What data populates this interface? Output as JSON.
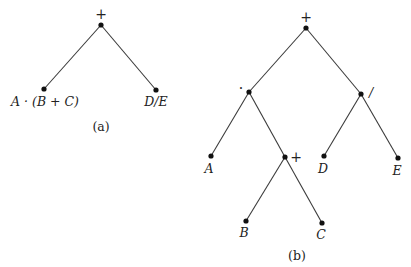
{
  "diagram_a": {
    "caption": "(a)",
    "root": {
      "label": "+",
      "x": 101,
      "y": 25
    },
    "left": {
      "label": "A · (B + C)",
      "x": 44,
      "y": 89
    },
    "right": {
      "label": "D/E",
      "x": 156,
      "y": 90
    }
  },
  "diagram_b": {
    "caption": "(b)",
    "nodes": {
      "root": {
        "label": "+",
        "x": 306,
        "y": 28
      },
      "mult": {
        "label": "·",
        "x": 249,
        "y": 92
      },
      "div": {
        "label": "/",
        "x": 361,
        "y": 94
      },
      "a": {
        "label": "A",
        "x": 211,
        "y": 156
      },
      "plus": {
        "label": "+",
        "x": 285,
        "y": 157
      },
      "d": {
        "label": "D",
        "x": 324,
        "y": 156
      },
      "e": {
        "label": "E",
        "x": 398,
        "y": 158
      },
      "b": {
        "label": "B",
        "x": 246,
        "y": 221
      },
      "c": {
        "label": "C",
        "x": 322,
        "y": 223
      }
    },
    "edges": [
      [
        "root",
        "mult"
      ],
      [
        "root",
        "div"
      ],
      [
        "mult",
        "a"
      ],
      [
        "mult",
        "plus"
      ],
      [
        "div",
        "d"
      ],
      [
        "div",
        "e"
      ],
      [
        "plus",
        "b"
      ],
      [
        "plus",
        "c"
      ]
    ]
  }
}
